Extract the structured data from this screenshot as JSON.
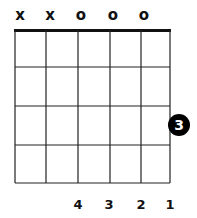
{
  "chord_diagram": {
    "strings": 6,
    "frets_shown": 4,
    "nut": true,
    "string_markers": [
      "x",
      "x",
      "o",
      "o",
      "o",
      ""
    ],
    "dots": [
      {
        "string": 6,
        "fret": 3,
        "finger": "3"
      }
    ],
    "finger_labels": [
      "",
      "",
      "4",
      "3",
      "2",
      "1"
    ],
    "colors": {
      "line": "#111111",
      "dot": "#000000",
      "dot_text": "#ffffff",
      "background": "#ffffff"
    }
  }
}
